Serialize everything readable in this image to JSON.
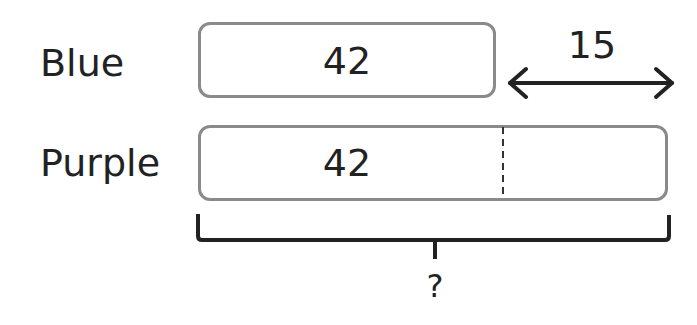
{
  "rows": [
    {
      "label": "Blue",
      "value": "42"
    },
    {
      "label": "Purple",
      "value": "42"
    }
  ],
  "difference": {
    "value": "15"
  },
  "total": {
    "label": "?"
  },
  "colors": {
    "box_border": "#8a8a8a",
    "text": "#222222",
    "line": "#222222"
  }
}
